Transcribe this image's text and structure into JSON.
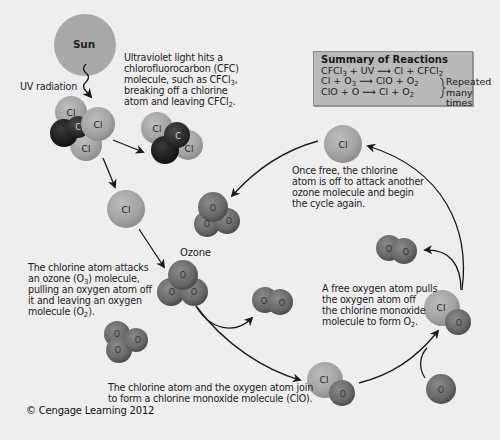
{
  "diagram": {
    "colors": {
      "background": "#eeeeee",
      "chlorine": "#a6a6a6",
      "oxygen": "#6e6e6e",
      "carbon": "#2e2e2e",
      "fluorine": "#1f1f1f",
      "sun": "#a9a9a9",
      "summary_box": "#b9b9b9",
      "arrow": "#1a1a1a"
    },
    "sun": {
      "label": "Sun"
    },
    "uv": {
      "label": "UV radiation"
    },
    "captions": {
      "cfc": {
        "line1": "Ultraviolet light hits a",
        "line2": "chlorofluorocarbon (CFC)",
        "line3a": "molecule, such as CFCl",
        "line3sub": "3",
        "line3b": ",",
        "line4": "breaking off a chlorine",
        "line5a": "atom and leaving CFCl",
        "line5sub": "2",
        "line5b": "."
      },
      "attack": {
        "line1": "The chlorine atom attacks",
        "line2a": "an ozone (O",
        "line2sub": "3",
        "line2b": ") molecule,",
        "line3": "pulling an oxygen atom off",
        "line4": "it and leaving an oxygen",
        "line5a": "molecule (O",
        "line5sub": "2",
        "line5b": ")."
      },
      "join": {
        "line1": "The chlorine atom and the oxygen atom join",
        "line2": "to form a chlorine monoxide molecule (ClO)."
      },
      "free_oxygen": {
        "line1": "A free oxygen atom pulls",
        "line2": "the oxygen atom off",
        "line3": "the chlorine monoxide",
        "line4a": "molecule to form O",
        "line4sub": "2",
        "line4b": "."
      },
      "cycle": {
        "line1": "Once free, the chlorine",
        "line2": "atom is off to attack another",
        "line3": "ozone molecule and begin",
        "line4": "the cycle again."
      }
    },
    "ozone_label": "Ozone",
    "summary": {
      "title": "Summary of Reactions",
      "r1": {
        "a": "CFCl",
        "a_sub": "3",
        "b": " + UV ",
        "arrow": "⟶",
        "c": " Cl + CFCl",
        "c_sub": "2"
      },
      "r2": {
        "a": "Cl + O",
        "a_sub": "3",
        "arrow": "⟶",
        "c": " ClO + O",
        "c_sub": "2"
      },
      "r3": {
        "a": "ClO + O ",
        "arrow": "⟶",
        "c": " Cl + O",
        "c_sub": "2"
      },
      "brace_note_line1": "Repeated",
      "brace_note_line2": "many times"
    },
    "atom_labels": {
      "cl": "Cl",
      "c": "C",
      "o": "O",
      "f": "F"
    },
    "copyright": "© Cengage Learning 2012"
  }
}
